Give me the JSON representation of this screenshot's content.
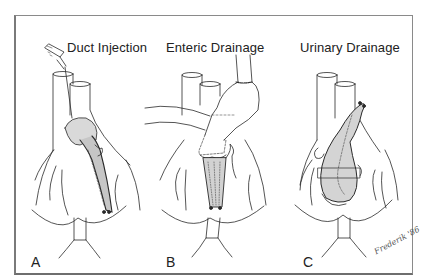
{
  "figure": {
    "panels": [
      {
        "id": "A",
        "title": "Duct Injection",
        "letter": "A"
      },
      {
        "id": "B",
        "title": "Enteric Drainage",
        "letter": "B"
      },
      {
        "id": "C",
        "title": "Urinary Drainage",
        "letter": "C"
      }
    ],
    "signature": "Frederik '86"
  },
  "colors": {
    "line": "#2a2a2a",
    "graft_fill": "#d9d9d9",
    "frame": "#7a7a7a",
    "background": "#ffffff"
  }
}
